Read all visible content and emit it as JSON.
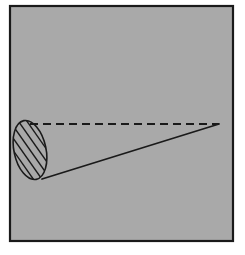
{
  "figure": {
    "caption": "",
    "canvas": {
      "width": 245,
      "height": 255,
      "background": "#ffffff"
    },
    "panel": {
      "name": "diagram-panel",
      "x": 10,
      "y": 6,
      "width": 223,
      "height": 235,
      "fill": "#a9a9a9",
      "stroke": "#1a1a1a",
      "stroke_width": 2.2
    },
    "ellipse": {
      "name": "hatched-ellipse",
      "center_x": 30,
      "center_y": 150,
      "radius_x": 16,
      "radius_y": 30,
      "rotation_deg": -12,
      "stroke": "#1a1a1a",
      "stroke_width": 1.6,
      "fill": "none",
      "hatch": {
        "pattern": "diagonal-lines",
        "angle_deg": 55,
        "spacing": 7,
        "stroke": "#1a1a1a",
        "stroke_width": 1.4,
        "line_count": 5
      }
    },
    "dashed_axis": {
      "name": "dashed-axis-line",
      "x1": 30,
      "y1": 124,
      "x2": 219,
      "y2": 124,
      "stroke": "#1a1a1a",
      "stroke_width": 2.2,
      "dash_length": 8,
      "gap_length": 5
    },
    "slant_line": {
      "name": "slant-generator-line",
      "x1": 42,
      "y1": 179,
      "x2": 219,
      "y2": 124,
      "stroke": "#1a1a1a",
      "stroke_width": 1.8
    },
    "apex": {
      "name": "apex-point",
      "x": 219,
      "y": 124
    },
    "labels": []
  }
}
